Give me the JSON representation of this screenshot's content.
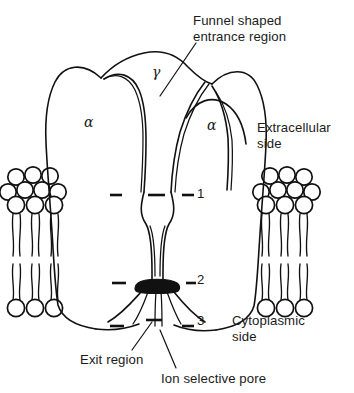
{
  "figure": {
    "kind": "ion-channel-membrane-diagram",
    "title_text": "",
    "background": "#ffffff",
    "ink_color": "#111111"
  },
  "annotations": {
    "funnel": "Funnel shaped\nentrance region",
    "extracellular": "Extracellular\nside",
    "cytoplasmic": "Cytoplasmic\nside",
    "exit": "Exit region",
    "pore": "Ion selective pore"
  },
  "subunits": {
    "alpha_left": "α",
    "alpha_right": "α",
    "gamma": "γ"
  },
  "levels": [
    {
      "id": "1",
      "label": "1"
    },
    {
      "id": "2",
      "label": "2"
    },
    {
      "id": "3",
      "label": "3"
    }
  ],
  "membrane": {
    "left_leaflet_head_rows": 3,
    "right_leaflet_head_rows": 3,
    "lower_leaflet_head_rows": 1,
    "head_shape": "circle"
  }
}
